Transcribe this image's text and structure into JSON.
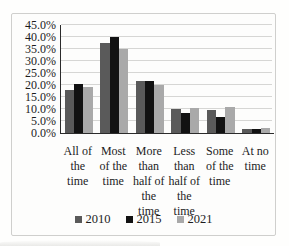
{
  "chart_data": {
    "type": "bar",
    "title": "",
    "xlabel": "",
    "ylabel": "",
    "categories": [
      "All of\nthe\ntime",
      "Most\nof the\ntime",
      "More\nthan\nhalf of\nthe\ntime",
      "Less\nthan\nhalf of\nthe\ntime",
      "Some\nof the\ntime",
      "At no\ntime"
    ],
    "series": [
      {
        "name": "2010",
        "color": "#5a5a5a",
        "values": [
          18,
          37.5,
          21.5,
          10,
          9.5,
          1.5
        ]
      },
      {
        "name": "2015",
        "color": "#121212",
        "values": [
          20.5,
          40,
          21.5,
          8.5,
          6.5,
          1.5
        ]
      },
      {
        "name": "2021",
        "color": "#a9a9a9",
        "values": [
          19,
          35,
          20,
          10.5,
          11,
          2
        ]
      }
    ],
    "ylim": [
      0,
      45
    ],
    "ytick_step": 5,
    "ytick_labels": [
      "0.0%",
      "5.0%",
      "10.0%",
      "15.0%",
      "20.0%",
      "25.0%",
      "30.0%",
      "35.0%",
      "40.0%",
      "45.0%"
    ],
    "grid": true,
    "legend_position": "bottom"
  },
  "colors": {
    "gridline": "#d6d6d4",
    "axis": "#2b2b2b",
    "frame_border": "#cfcfcd",
    "background": "#fdfdfc"
  }
}
